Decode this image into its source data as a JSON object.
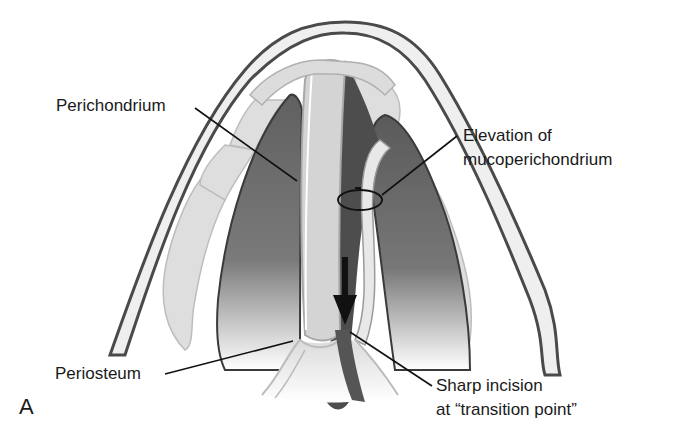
{
  "figure": {
    "panel_letter": "A",
    "colors": {
      "outline": "#4a4a4a",
      "skin_fill": "#f0f0f0",
      "cartilage_fill": "#dcdcdc",
      "cavity_dark": "#5e5e5e",
      "cavity_darker": "#444444",
      "leader_line": "#111111"
    }
  },
  "labels": {
    "perichondrium": "Perichondrium",
    "elevation_line1": "Elevation of",
    "elevation_line2": "mucoperichondrium",
    "periosteum": "Periosteum",
    "incision_line1": "Sharp incision",
    "incision_line2": "at “transition point”"
  },
  "annotations": {
    "arrow": "down-arrow",
    "marker": "ellipse-marker"
  }
}
